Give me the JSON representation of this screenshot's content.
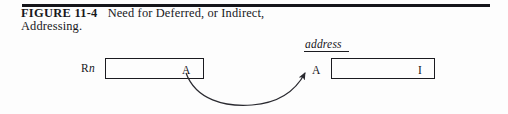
{
  "figure": {
    "label": "FIGURE 11-4",
    "caption_line1": "Need for Deferred, or Indirect,",
    "caption_line2": "Addressing.",
    "rule_color": "#15151a"
  },
  "diagram": {
    "register_label_prefix": "R",
    "register_label_subscript": "n",
    "source_box_value": "A",
    "address_label": "address",
    "pointer_value": "A",
    "target_box_value": "I",
    "arrow": {
      "from_label": "A",
      "to_label": "A",
      "style": "curved-arrow",
      "color": "#2a2a30"
    },
    "line_color": "#1b1b20"
  }
}
